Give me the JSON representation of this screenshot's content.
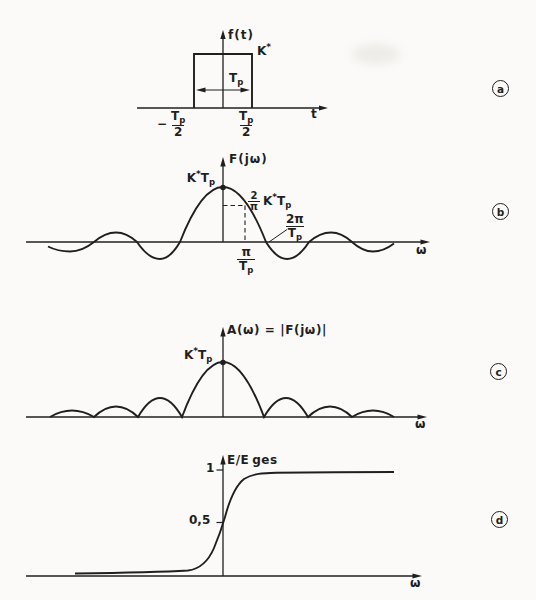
{
  "colors": {
    "ink": "#1f1f1f",
    "paper": "#fbfaf8"
  },
  "panel_a": {
    "marker": "a",
    "y_label": "f(t)",
    "x_label": "t",
    "amp_base": "K",
    "amp_sup": "*",
    "width_base": "T",
    "width_sub": "p",
    "tick_left": {
      "sign": "−",
      "num": "T",
      "num_sub": "p",
      "den": "2"
    },
    "tick_right": {
      "num": "T",
      "num_sub": "p",
      "den": "2"
    }
  },
  "panel_b": {
    "marker": "b",
    "y_label": "F(jω)",
    "x_label": "ω",
    "peak": {
      "base": "K",
      "sup": "*",
      "base2": "T",
      "sub": "p"
    },
    "point": {
      "num": "2",
      "den": "π",
      "base": "K",
      "sup": "*",
      "base2": "T",
      "sub": "p"
    },
    "zero_label": {
      "num": "2π",
      "den": "T",
      "den_sub": "p"
    },
    "x_tick": {
      "num": "π",
      "den": "T",
      "den_sub": "p"
    }
  },
  "panel_c": {
    "marker": "c",
    "y_label": "A(ω) = |F(jω)|",
    "x_label": "ω",
    "peak": {
      "base": "K",
      "sup": "*",
      "base2": "T",
      "sub": "p"
    }
  },
  "panel_d": {
    "marker": "d",
    "y_label_base": "E/E",
    "y_label_sub": "ges",
    "x_label": "ω",
    "tick_one": "1",
    "tick_half": "0,5"
  }
}
